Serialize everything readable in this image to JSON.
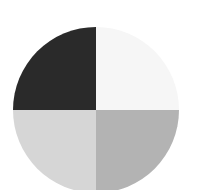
{
  "chart_data": {
    "type": "pie",
    "title": "",
    "categories": [
      "Top-left",
      "Top-right",
      "Bottom-right",
      "Bottom-left"
    ],
    "values": [
      25,
      25,
      25,
      25
    ],
    "colors": [
      "#2a2a2a",
      "#f6f6f6",
      "#b3b3b3",
      "#d6d6d6"
    ],
    "legend": [],
    "center": [
      96,
      110
    ],
    "radius": 83
  }
}
